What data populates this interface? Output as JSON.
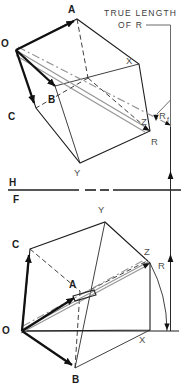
{
  "colors": {
    "ink": "#1e1e1e",
    "construction_gray": "#979797",
    "label_gray": "#4f4f4f",
    "background": "#ffffff"
  },
  "annotation": {
    "line1": "TRUE LENGTH",
    "line2": "OF R"
  },
  "fold_line": {
    "upper_label": "H",
    "lower_label": "F"
  },
  "top_view": {
    "labels": {
      "O": "O",
      "A": "A",
      "B": "B",
      "C": "C",
      "X": "X",
      "Y": "Y",
      "Z": "Z",
      "R": "R",
      "Rf_main": "R",
      "Rf_sub": "f"
    }
  },
  "front_view": {
    "labels": {
      "O": "O",
      "A": "A",
      "B": "B",
      "C": "C",
      "X": "X",
      "Y": "Y",
      "Z": "Z",
      "R": "R"
    }
  }
}
